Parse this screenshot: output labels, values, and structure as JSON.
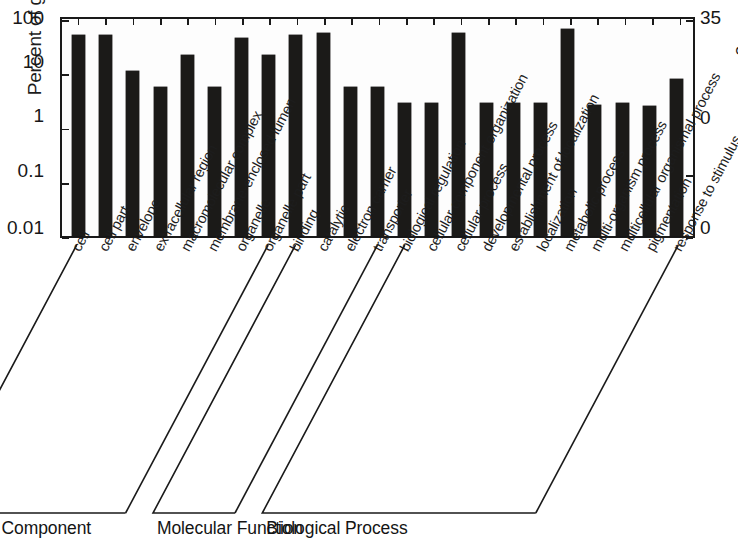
{
  "chart_data": {
    "type": "bar",
    "title": "",
    "ylabel": "Percent of genes",
    "ylabel_right": "Number of genes",
    "xlabel": "",
    "yscale": "log",
    "ylim": [
      0.01,
      100
    ],
    "ytick_labels": [
      "100",
      "10",
      "1",
      "0.1",
      "0.01"
    ],
    "ytick_values": [
      100,
      10,
      1,
      0.1,
      0.01
    ],
    "ylim_right": [
      0,
      35
    ],
    "ytick_labels_right": [
      "35",
      "0",
      "0"
    ],
    "ytick_values_right": [
      35,
      10,
      0
    ],
    "grid": false,
    "legend": "none",
    "categories": [
      "cell",
      "cell part",
      "envelope",
      "extracellular region",
      "macromolecular complex",
      "membrane-enclosed lumen",
      "organelle",
      "organelle part",
      "binding",
      "catalytic",
      "electron carrier",
      "transporter",
      "biological regulation",
      "cellular component organization",
      "cellular process",
      "developmental process",
      "establishment of localization",
      "localization",
      "metabolic process",
      "multi-organism process",
      "multicellular organismal process",
      "pigmentation",
      "response to stimulus"
    ],
    "values": [
      50,
      50,
      11,
      5.6,
      22,
      5.6,
      44,
      22,
      50,
      55,
      5.6,
      5.6,
      2.8,
      2.8,
      55,
      2.8,
      2.8,
      2.8,
      66,
      2.6,
      2.8,
      2.5,
      8
    ],
    "groups": [
      {
        "label": "Cellular Component",
        "start": 0,
        "end": 7
      },
      {
        "label": "Molecular Function",
        "start": 8,
        "end": 11
      },
      {
        "label": "Biological Process",
        "start": 12,
        "end": 22
      }
    ],
    "bar_color": "#1b1a18"
  }
}
